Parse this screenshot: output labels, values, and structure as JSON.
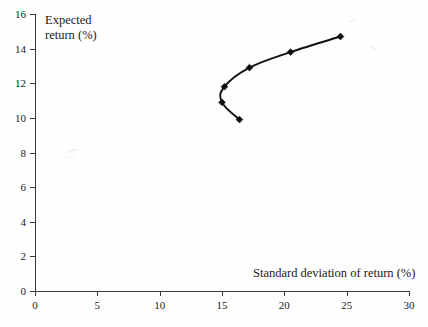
{
  "chart_data": {
    "type": "line",
    "title": "",
    "xlabel": "Standard deviation of return (%)",
    "ylabel": "Expected return (%)",
    "xlim": [
      0,
      30
    ],
    "ylim": [
      0,
      16
    ],
    "xticks": [
      0,
      5,
      10,
      15,
      20,
      25,
      30
    ],
    "yticks": [
      0,
      2,
      4,
      6,
      8,
      10,
      12,
      14,
      16
    ],
    "xtick_labels": [
      "0",
      "5",
      "10",
      "15",
      "20",
      "25",
      "30"
    ],
    "ytick_labels": [
      "0",
      "2",
      "4",
      "6",
      "8",
      "10",
      "12",
      "14",
      "16"
    ],
    "grid": false,
    "legend": null,
    "marker": "diamond",
    "line_color": "#111111",
    "marker_color": "#0d0d0d",
    "series": [
      {
        "name": "Efficient frontier",
        "points": [
          {
            "x": 16.4,
            "y": 9.9
          },
          {
            "x": 15.0,
            "y": 10.9
          },
          {
            "x": 15.2,
            "y": 11.8
          },
          {
            "x": 17.2,
            "y": 12.9
          },
          {
            "x": 20.5,
            "y": 13.8
          },
          {
            "x": 24.5,
            "y": 14.7
          }
        ]
      }
    ]
  },
  "axes": {
    "x_title": "Standard deviation of return (%)",
    "y_title_line1": "Expected",
    "y_title_line2": "return (%)"
  },
  "x_tick_labels": [
    "0",
    "5",
    "10",
    "15",
    "20",
    "25",
    "30"
  ],
  "y_tick_labels": [
    "0",
    "2",
    "4",
    "6",
    "8",
    "10",
    "12",
    "14",
    "16"
  ]
}
